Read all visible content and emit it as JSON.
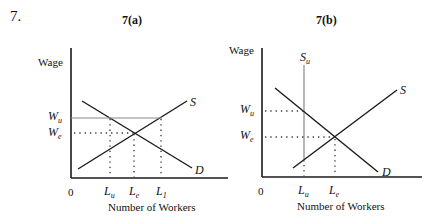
{
  "question_number": "7.",
  "panels": [
    {
      "id": "a",
      "title": "7(a)",
      "y_axis_label": "Wage",
      "x_axis_label": "Number of Workers",
      "origin_label": "0",
      "wage_labels": [
        {
          "main": "W",
          "sub": "u"
        },
        {
          "main": "W",
          "sub": "e"
        }
      ],
      "quantity_labels": [
        {
          "main": "L",
          "sub": "u"
        },
        {
          "main": "L",
          "sub": "e"
        },
        {
          "main": "L",
          "sub": "1"
        }
      ],
      "curve_labels": {
        "supply": "S",
        "demand": "D"
      }
    },
    {
      "id": "b",
      "title": "7(b)",
      "y_axis_label": "Wage",
      "x_axis_label": "Number of Workers",
      "origin_label": "0",
      "wage_labels": [
        {
          "main": "W",
          "sub": "u"
        },
        {
          "main": "W",
          "sub": "e"
        }
      ],
      "quantity_labels": [
        {
          "main": "L",
          "sub": "u"
        },
        {
          "main": "L",
          "sub": "e"
        }
      ],
      "curve_labels": {
        "supply": "S",
        "demand": "D",
        "union_supply_main": "S",
        "union_supply_sub": "u"
      }
    }
  ],
  "colors": {
    "line": "#1a1a1a",
    "wage_floor_line": "#888888",
    "dots": "#333333"
  }
}
